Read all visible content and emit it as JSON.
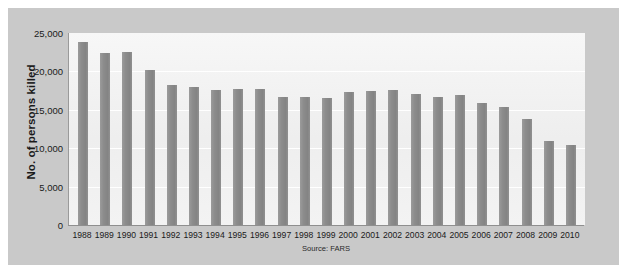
{
  "chart_data": {
    "type": "bar",
    "title": "",
    "subtitle": "",
    "xlabel": "",
    "ylabel": "No. of persons killed",
    "source_note": "Source: FARS",
    "ylim": [
      0,
      25000
    ],
    "yticks": [
      "0",
      "5,000",
      "10,000",
      "15,000",
      "20,000",
      "25,000"
    ],
    "ytick_values": [
      0,
      5000,
      10000,
      15000,
      20000,
      25000
    ],
    "grid": true,
    "legend": "none",
    "bar_color": "#8c8c8c",
    "plot_background": "#f2f2f2",
    "panel_background": "#c9c9c9",
    "categories": [
      "1988",
      "1989",
      "1990",
      "1991",
      "1992",
      "1993",
      "1994",
      "1995",
      "1996",
      "1997",
      "1998",
      "1999",
      "2000",
      "2001",
      "2002",
      "2003",
      "2004",
      "2005",
      "2006",
      "2007",
      "2008",
      "2009",
      "2010"
    ],
    "values": [
      23833,
      22424,
      22587,
      20159,
      18290,
      17908,
      17524,
      17732,
      17749,
      16711,
      16673,
      16572,
      17380,
      17400,
      17524,
      17105,
      16694,
      16885,
      15829,
      15387,
      13846,
      10909,
      10436
    ]
  }
}
